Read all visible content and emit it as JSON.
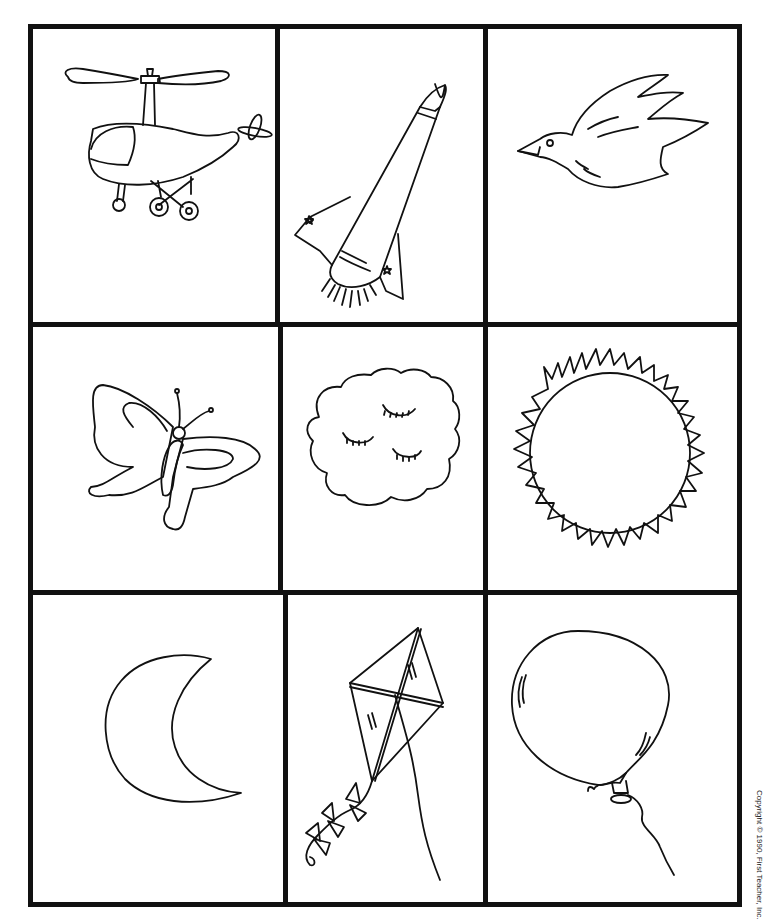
{
  "worksheet": {
    "layout": {
      "rows": 3,
      "columns": 3
    },
    "border_color": "#111111",
    "background_color": "#ffffff",
    "cells": [
      {
        "row": 1,
        "col": 1,
        "picture": "helicopter"
      },
      {
        "row": 1,
        "col": 2,
        "picture": "rocket"
      },
      {
        "row": 1,
        "col": 3,
        "picture": "bird"
      },
      {
        "row": 2,
        "col": 1,
        "picture": "butterfly"
      },
      {
        "row": 2,
        "col": 2,
        "picture": "cloud"
      },
      {
        "row": 2,
        "col": 3,
        "picture": "sun"
      },
      {
        "row": 3,
        "col": 1,
        "picture": "moon"
      },
      {
        "row": 3,
        "col": 2,
        "picture": "kite"
      },
      {
        "row": 3,
        "col": 3,
        "picture": "balloon"
      }
    ],
    "copyright": "Copyright © 1990, First Teacher, Inc."
  }
}
